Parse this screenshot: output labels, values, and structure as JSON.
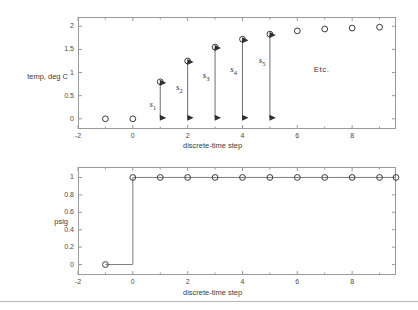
{
  "figure": {
    "background": "#ffffff",
    "axis_color": "#9a9a9a",
    "marker_color": "#3a3a3a",
    "arrow_color": "#2e2e2e",
    "divider": true
  },
  "panels": [
    {
      "id": "top",
      "ylabel": "temp, deg C",
      "xlabel": "discrete-time step",
      "xticks": [
        "-2",
        "0",
        "2",
        "4",
        "6",
        "8"
      ],
      "xtickvals": [
        -2,
        0,
        2,
        4,
        6,
        8
      ],
      "yticks": [
        "0",
        "0.5",
        "1",
        "1.5",
        "2"
      ],
      "ytickvals": [
        0,
        0.5,
        1,
        1.5,
        2
      ],
      "xlim": [
        -2,
        9.6
      ],
      "ylim": [
        -0.22,
        2.2
      ],
      "annotations": [
        {
          "label": "s",
          "sub": "1",
          "x": 1,
          "y0": 0,
          "y1": 0.8,
          "lx": 0.72,
          "ly": 0.3
        },
        {
          "label": "s",
          "sub": "2",
          "x": 2,
          "y0": 0,
          "y1": 1.25,
          "lx": 1.68,
          "ly": 0.66
        },
        {
          "label": "s",
          "sub": "3",
          "x": 3,
          "y0": 0,
          "y1": 1.55,
          "lx": 2.66,
          "ly": 0.92
        },
        {
          "label": "s",
          "sub": "4",
          "x": 4,
          "y0": 0,
          "y1": 1.72,
          "lx": 3.66,
          "ly": 1.06
        },
        {
          "label": "s",
          "sub": "5",
          "x": 5,
          "y0": 0,
          "y1": 1.83,
          "lx": 4.7,
          "ly": 1.25
        }
      ],
      "etc": {
        "text": "Etc.",
        "x": 6.6,
        "y": 1.05
      }
    },
    {
      "id": "bottom",
      "ylabel": "psig",
      "xlabel": "discrete-time step",
      "xticks": [
        "-2",
        "0",
        "2",
        "4",
        "6",
        "8"
      ],
      "xtickvals": [
        -2,
        0,
        2,
        4,
        6,
        8
      ],
      "yticks": [
        "0",
        "0.2",
        "0.4",
        "0.6",
        "0.8",
        "1"
      ],
      "ytickvals": [
        0,
        0.2,
        0.4,
        0.6,
        0.8,
        1
      ],
      "xlim": [
        -2,
        9.6
      ],
      "ylim": [
        -0.12,
        1.12
      ]
    }
  ],
  "chart_data": [
    {
      "type": "scatter",
      "title": "",
      "xlabel": "discrete-time step",
      "ylabel": "temp, deg C",
      "xlim": [
        -2,
        9.6
      ],
      "ylim": [
        -0.22,
        2.2
      ],
      "grid": false,
      "legend": "none",
      "marker": "open-circle",
      "x": [
        -1,
        0,
        1,
        2,
        3,
        4,
        5,
        6,
        7,
        8,
        9
      ],
      "y": [
        0,
        0,
        0.8,
        1.25,
        1.55,
        1.72,
        1.83,
        1.9,
        1.94,
        1.96,
        1.98
      ],
      "annotations": [
        "s1",
        "s2",
        "s3",
        "s4",
        "s5",
        "Etc."
      ]
    },
    {
      "type": "line",
      "title": "",
      "xlabel": "discrete-time step",
      "ylabel": "psig",
      "xlim": [
        -2,
        9.6
      ],
      "ylim": [
        -0.12,
        1.12
      ],
      "grid": false,
      "legend": "none",
      "marker": "open-circle",
      "step": true,
      "x": [
        -1,
        0,
        1,
        2,
        3,
        4,
        5,
        6,
        7,
        8,
        9,
        9.6
      ],
      "y": [
        0,
        1,
        1,
        1,
        1,
        1,
        1,
        1,
        1,
        1,
        1,
        1
      ]
    }
  ]
}
